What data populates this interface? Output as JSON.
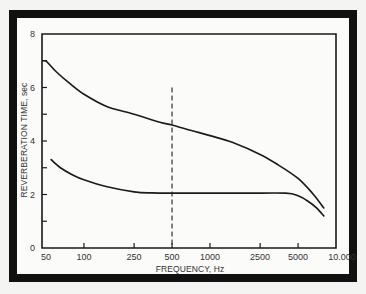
{
  "chart_data": {
    "type": "line",
    "title": "",
    "xlabel": "FREQUENCY, Hz",
    "ylabel": "REVERBERATION TIME, sec",
    "x_scale": "log",
    "xlim": [
      50,
      10000
    ],
    "ylim": [
      0,
      8
    ],
    "x_ticks": [
      50,
      100,
      250,
      500,
      1000,
      2500,
      5000,
      10000
    ],
    "x_tick_labels": [
      "50",
      "100",
      "250",
      "500",
      "1000",
      "2500",
      "5000",
      "10.000"
    ],
    "y_ticks": [
      0,
      2,
      4,
      6,
      8
    ],
    "y_tick_labels": [
      "0",
      "2",
      "4",
      "6",
      "8"
    ],
    "y_minor_ticks": [
      1,
      3,
      5,
      7
    ],
    "grid": false,
    "legend": null,
    "series": [
      {
        "name": "upper curve",
        "x": [
          50,
          60,
          75,
          100,
          150,
          250,
          400,
          500,
          700,
          1000,
          1500,
          2500,
          3500,
          5000,
          6500,
          8000
        ],
        "y": [
          7.0,
          6.6,
          6.2,
          5.75,
          5.3,
          5.0,
          4.7,
          4.6,
          4.4,
          4.2,
          3.95,
          3.5,
          3.1,
          2.6,
          2.05,
          1.5
        ]
      },
      {
        "name": "lower curve",
        "x": [
          55,
          65,
          80,
          100,
          150,
          250,
          350,
          500,
          1000,
          2000,
          4000,
          5000,
          6000,
          7000,
          8000
        ],
        "y": [
          3.3,
          3.0,
          2.75,
          2.55,
          2.3,
          2.1,
          2.06,
          2.05,
          2.05,
          2.05,
          2.05,
          1.95,
          1.75,
          1.5,
          1.2
        ]
      }
    ],
    "annotations": [
      {
        "type": "vertical-dashed-line",
        "x": 500,
        "y_from": 0,
        "y_to": 6
      }
    ]
  }
}
